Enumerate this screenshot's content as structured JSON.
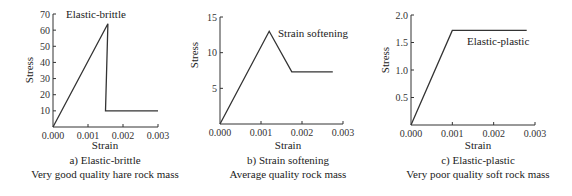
{
  "chart_data": [
    {
      "type": "line",
      "id": "a",
      "title": "a) Elastic-brittle",
      "subtitle": "Very good quality hare rock mass",
      "xlabel": "Strain",
      "ylabel": "Stress",
      "xlim": [
        0,
        0.003
      ],
      "ylim": [
        0,
        70
      ],
      "xticks": [
        "0.000",
        "0.001",
        "0.002",
        "0.003"
      ],
      "xtick_values": [
        0,
        0.001,
        0.002,
        0.003
      ],
      "yticks": [
        "10",
        "20",
        "30",
        "40",
        "50",
        "60",
        "70"
      ],
      "ytick_values": [
        10,
        20,
        30,
        40,
        50,
        60,
        70
      ],
      "annotation": "Elastic-brittle",
      "series": [
        {
          "name": "Elastic-brittle",
          "x": [
            0,
            0.00157,
            0.0015,
            0.003
          ],
          "y": [
            0,
            64,
            10,
            10
          ]
        }
      ],
      "grid": false
    },
    {
      "type": "line",
      "id": "b",
      "title": "b) Strain softening",
      "subtitle": "Average quality rock mass",
      "xlabel": "Strain",
      "ylabel": "Stress",
      "xlim": [
        0,
        0.003
      ],
      "ylim": [
        0,
        15
      ],
      "xticks": [
        "0.000",
        "0.001",
        "0.002",
        "0.003"
      ],
      "xtick_values": [
        0,
        0.001,
        0.002,
        0.003
      ],
      "yticks": [
        "5",
        "10",
        "15"
      ],
      "ytick_values": [
        5,
        10,
        15
      ],
      "annotation": "Strain softening",
      "series": [
        {
          "name": "Strain softening",
          "x": [
            0,
            0.0012,
            0.00175,
            0.00275
          ],
          "y": [
            0,
            13,
            7.3,
            7.3
          ]
        }
      ],
      "grid": false
    },
    {
      "type": "line",
      "id": "c",
      "title": "c) Elastic-plastic",
      "subtitle": "Very poor quality soft rock mass",
      "xlabel": "Strain",
      "ylabel": "Stress",
      "xlim": [
        0,
        0.003
      ],
      "ylim": [
        0,
        2.0
      ],
      "xticks": [
        "0.000",
        "0.001",
        "0.002",
        "0.003"
      ],
      "xtick_values": [
        0,
        0.001,
        0.002,
        0.003
      ],
      "yticks": [
        "0.5",
        "1.0",
        "1.5",
        "2.0"
      ],
      "ytick_values": [
        0.5,
        1.0,
        1.5,
        2.0
      ],
      "annotation": "Elastic-plastic",
      "series": [
        {
          "name": "Elastic-plastic",
          "x": [
            0,
            0.001,
            0.0028
          ],
          "y": [
            0,
            1.72,
            1.72
          ]
        }
      ],
      "grid": false
    }
  ]
}
